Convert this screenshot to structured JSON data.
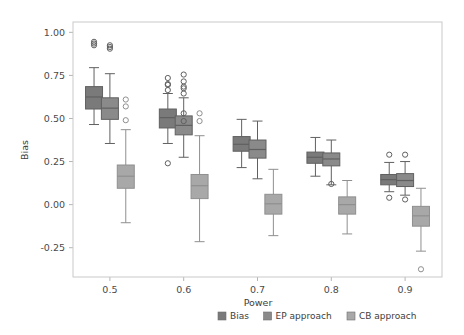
{
  "chart_data": {
    "type": "box",
    "title": "",
    "xlabel": "Power",
    "ylabel": "Bias",
    "xticklabels": [
      "0.5",
      "0.6",
      "0.7",
      "0.8",
      "0.9"
    ],
    "categories": [
      0.5,
      0.6,
      0.7,
      0.8,
      0.9
    ],
    "yticklabels": [
      "1.00",
      "0.75",
      "0.50",
      "0.25",
      "0.00",
      "-0.25"
    ],
    "yticks": [
      1.0,
      0.75,
      0.5,
      0.25,
      0.0,
      -0.25
    ],
    "ylim": [
      -0.42,
      1.06
    ],
    "xlim": [
      0.45,
      0.95
    ],
    "grid": false,
    "legend_position": "bottom-right",
    "colors": {
      "bias": "#7a7a7a",
      "ep_approach": "#8a8a8a",
      "cb_approach": "#a8a8a8",
      "frame": "#c9c9c9",
      "text": "#3d3d3d"
    },
    "legend": [
      {
        "label": "Bias",
        "color": "#7a7a7a"
      },
      {
        "label": "EP approach",
        "color": "#8a8a8a"
      },
      {
        "label": "CB approach",
        "color": "#a8a8a8"
      }
    ],
    "series": [
      {
        "name": "Bias",
        "color": "#7a7a7a",
        "boxes": [
          {
            "category": "0.5",
            "min": 0.465,
            "q1": 0.555,
            "median": 0.625,
            "q3": 0.685,
            "max": 0.795,
            "outliers": [
              0.925,
              0.935,
              0.945
            ]
          },
          {
            "category": "0.6",
            "min": 0.355,
            "q1": 0.445,
            "median": 0.505,
            "q3": 0.555,
            "max": 0.645,
            "outliers": [
              0.665,
              0.695,
              0.7,
              0.735,
              0.24
            ]
          },
          {
            "category": "0.7",
            "min": 0.215,
            "q1": 0.31,
            "median": 0.35,
            "q3": 0.395,
            "max": 0.495,
            "outliers": []
          },
          {
            "category": "0.8",
            "min": 0.165,
            "q1": 0.24,
            "median": 0.275,
            "q3": 0.305,
            "max": 0.39,
            "outliers": []
          },
          {
            "category": "0.9",
            "min": 0.075,
            "q1": 0.115,
            "median": 0.145,
            "q3": 0.175,
            "max": 0.245,
            "outliers": [
              0.29,
              0.04
            ]
          }
        ]
      },
      {
        "name": "EP approach",
        "color": "#8a8a8a",
        "boxes": [
          {
            "category": "0.5",
            "min": 0.355,
            "q1": 0.495,
            "median": 0.56,
            "q3": 0.62,
            "max": 0.76,
            "outliers": [
              0.905,
              0.915,
              0.925
            ]
          },
          {
            "category": "0.6",
            "min": 0.275,
            "q1": 0.405,
            "median": 0.46,
            "q3": 0.515,
            "max": 0.62,
            "outliers": [
              0.645,
              0.675,
              0.685,
              0.715,
              0.755,
              0.53,
              0.485
            ]
          },
          {
            "category": "0.7",
            "min": 0.15,
            "q1": 0.27,
            "median": 0.32,
            "q3": 0.375,
            "max": 0.485,
            "outliers": []
          },
          {
            "category": "0.8",
            "min": 0.115,
            "q1": 0.225,
            "median": 0.265,
            "q3": 0.3,
            "max": 0.375,
            "outliers": [
              0.12
            ]
          },
          {
            "category": "0.9",
            "min": 0.055,
            "q1": 0.105,
            "median": 0.14,
            "q3": 0.18,
            "max": 0.25,
            "outliers": [
              0.29,
              0.03
            ]
          }
        ]
      },
      {
        "name": "CB approach",
        "color": "#a8a8a8",
        "boxes": [
          {
            "category": "0.5",
            "min": -0.105,
            "q1": 0.095,
            "median": 0.165,
            "q3": 0.23,
            "max": 0.435,
            "outliers": [
              0.49,
              0.57,
              0.61
            ]
          },
          {
            "category": "0.6",
            "min": -0.215,
            "q1": 0.035,
            "median": 0.11,
            "q3": 0.175,
            "max": 0.4,
            "outliers": [
              0.485,
              0.53
            ]
          },
          {
            "category": "0.7",
            "min": -0.18,
            "q1": -0.055,
            "median": 0.005,
            "q3": 0.06,
            "max": 0.205,
            "outliers": []
          },
          {
            "category": "0.8",
            "min": -0.17,
            "q1": -0.055,
            "median": 0.0,
            "q3": 0.045,
            "max": 0.14,
            "outliers": []
          },
          {
            "category": "0.9",
            "min": -0.27,
            "q1": -0.125,
            "median": -0.065,
            "q3": -0.01,
            "max": 0.095,
            "outliers": [
              -0.375
            ]
          }
        ]
      }
    ]
  }
}
